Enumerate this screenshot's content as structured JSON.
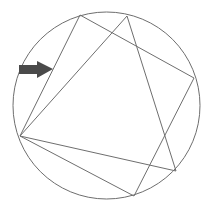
{
  "diagram": {
    "colors": {
      "background": "#ffffff",
      "stroke": "#6e6e6e",
      "arrow": "#4a4a4a"
    },
    "circle": {
      "cx": 106.5,
      "cy": 105.5,
      "r": 93.5
    },
    "quadrilateral": {
      "points": [
        [
          80,
          15
        ],
        [
          194,
          78
        ],
        [
          134,
          196
        ],
        [
          20,
          136
        ]
      ]
    },
    "triangle": {
      "points": [
        [
          127,
          16
        ],
        [
          176,
          171
        ],
        [
          20,
          136
        ]
      ]
    },
    "arrow": {
      "direction": "right",
      "shaft": {
        "x1": 19,
        "x2": 37,
        "y1": 65,
        "y2": 74
      },
      "head": {
        "base_x": 37,
        "tip_x": 53,
        "top_y": 61,
        "bottom_y": 78,
        "tip_y": 69
      }
    }
  }
}
